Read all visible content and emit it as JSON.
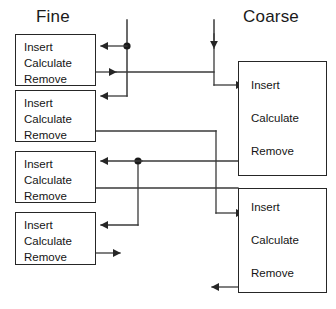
{
  "diagram": {
    "columns": {
      "fine_label": "Fine",
      "coarse_label": "Coarse"
    },
    "operations": [
      "Insert",
      "Calculate",
      "Remove"
    ],
    "fine_processes": [
      {
        "id": "fine-1",
        "ops": [
          "Insert",
          "Calculate",
          "Remove"
        ]
      },
      {
        "id": "fine-2",
        "ops": [
          "Insert",
          "Calculate",
          "Remove"
        ]
      },
      {
        "id": "fine-3",
        "ops": [
          "Insert",
          "Calculate",
          "Remove"
        ]
      },
      {
        "id": "fine-4",
        "ops": [
          "Insert",
          "Calculate",
          "Remove"
        ]
      }
    ],
    "coarse_processes": [
      {
        "id": "coarse-1",
        "ops": [
          "Insert",
          "Calculate",
          "Remove"
        ]
      },
      {
        "id": "coarse-2",
        "ops": [
          "Insert",
          "Calculate",
          "Remove"
        ]
      }
    ],
    "colors": {
      "stroke": "#262626",
      "wire": "#3a3a3a",
      "text": "#151515",
      "background": "#ffffff"
    }
  }
}
